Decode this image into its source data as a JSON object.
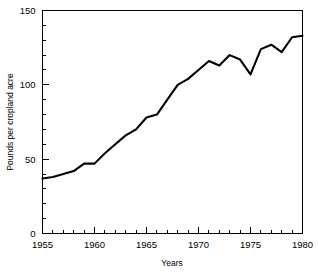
{
  "chart_data": {
    "type": "line",
    "title": "",
    "xlabel": "Years",
    "ylabel": "Pounds per cropland acre",
    "xlim": [
      1955,
      1980
    ],
    "ylim": [
      0,
      150
    ],
    "grid": false,
    "legend": null,
    "x_ticks_major": [
      1955,
      1960,
      1965,
      1970,
      1975,
      1980
    ],
    "x_tick_labels": [
      "1955",
      "1960",
      "1965",
      "1970",
      "1975",
      "1980"
    ],
    "x_tick_minor_step": 1,
    "y_ticks_major": [
      0,
      50,
      100,
      150
    ],
    "y_tick_labels": [
      "0",
      "50",
      "100",
      "150"
    ],
    "y_tick_minor_step": 10,
    "x": [
      1955,
      1956,
      1957,
      1958,
      1959,
      1960,
      1961,
      1962,
      1963,
      1964,
      1965,
      1966,
      1967,
      1968,
      1969,
      1970,
      1971,
      1972,
      1973,
      1974,
      1975,
      1976,
      1977,
      1978,
      1979,
      1980
    ],
    "values": [
      37,
      38,
      40,
      42,
      47,
      47,
      54,
      60,
      66,
      70,
      78,
      80,
      90,
      100,
      104,
      110,
      116,
      113,
      120,
      117,
      107,
      124,
      127,
      122,
      132,
      133
    ],
    "series": [
      {
        "name": "Pounds per cropland acre",
        "values": [
          37,
          38,
          40,
          42,
          47,
          47,
          54,
          60,
          66,
          70,
          78,
          80,
          90,
          100,
          104,
          110,
          116,
          113,
          120,
          117,
          107,
          124,
          127,
          122,
          132,
          133
        ]
      }
    ]
  },
  "axes": {
    "y_label": "Pounds per cropland acre",
    "x_label": "Years"
  }
}
